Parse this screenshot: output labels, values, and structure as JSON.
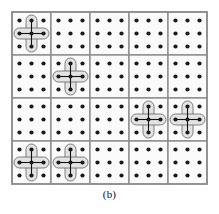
{
  "figure": {
    "caption": "(b)",
    "type": "grid-diagram"
  },
  "colors": {
    "background": "#ffffff",
    "cell_fill": "#fbfbfb",
    "cell_border": "#8c8c8c",
    "outer_border": "#8c8c8c",
    "dot": "#1a1a1a",
    "overlay_fill": "#e3e3e3",
    "overlay_stroke": "#6f6f6f",
    "overlay_link": "#111111",
    "caption_text": "#111111"
  },
  "geometry": {
    "origin_x": 12,
    "origin_y": 12,
    "cell_width": 39,
    "cell_height": 43,
    "cols": 5,
    "rows": 4,
    "dots_per_cell_x": 3,
    "dots_per_cell_y": 3,
    "dot_radius": 2.1,
    "dot_inset_x": 7.5,
    "dot_inset_y": 8.5,
    "dot_step_x": 12,
    "dot_step_y": 13,
    "overlay_capsule_width": 11,
    "overlay_corner_radius": 5.5,
    "cell_border_width": 1.4,
    "outer_border_width": 1.6
  },
  "grid": {
    "column_lines_x": [
      12,
      51,
      90,
      129,
      168,
      207
    ],
    "row_lines_y": [
      12,
      55,
      98,
      141,
      184
    ]
  },
  "cells": [
    {
      "row": 0,
      "col": 0,
      "has_overlay": true
    },
    {
      "row": 0,
      "col": 1,
      "has_overlay": false
    },
    {
      "row": 0,
      "col": 2,
      "has_overlay": false
    },
    {
      "row": 0,
      "col": 3,
      "has_overlay": false
    },
    {
      "row": 0,
      "col": 4,
      "has_overlay": false
    },
    {
      "row": 1,
      "col": 0,
      "has_overlay": false
    },
    {
      "row": 1,
      "col": 1,
      "has_overlay": true
    },
    {
      "row": 1,
      "col": 2,
      "has_overlay": false
    },
    {
      "row": 1,
      "col": 3,
      "has_overlay": false
    },
    {
      "row": 1,
      "col": 4,
      "has_overlay": false
    },
    {
      "row": 2,
      "col": 0,
      "has_overlay": false
    },
    {
      "row": 2,
      "col": 1,
      "has_overlay": false
    },
    {
      "row": 2,
      "col": 2,
      "has_overlay": false
    },
    {
      "row": 2,
      "col": 3,
      "has_overlay": true
    },
    {
      "row": 2,
      "col": 4,
      "has_overlay": true
    },
    {
      "row": 3,
      "col": 0,
      "has_overlay": true
    },
    {
      "row": 3,
      "col": 1,
      "has_overlay": true
    },
    {
      "row": 3,
      "col": 2,
      "has_overlay": false
    },
    {
      "row": 3,
      "col": 3,
      "has_overlay": false
    },
    {
      "row": 3,
      "col": 4,
      "has_overlay": false
    }
  ],
  "overlays": [
    {
      "id": "overlay-r0c0",
      "row": 0,
      "col": 0,
      "shape": "plus-pentomino",
      "center_dot": [
        1,
        1
      ]
    },
    {
      "id": "overlay-r1c1",
      "row": 1,
      "col": 1,
      "shape": "plus-pentomino",
      "center_dot": [
        1,
        1
      ]
    },
    {
      "id": "overlay-r2c3",
      "row": 2,
      "col": 3,
      "shape": "plus-pentomino",
      "center_dot": [
        1,
        1
      ]
    },
    {
      "id": "overlay-r2c4",
      "row": 2,
      "col": 4,
      "shape": "plus-pentomino",
      "center_dot": [
        1,
        1
      ]
    },
    {
      "id": "overlay-r3c0",
      "row": 3,
      "col": 0,
      "shape": "plus-pentomino",
      "center_dot": [
        1,
        1
      ]
    },
    {
      "id": "overlay-r3c1",
      "row": 3,
      "col": 1,
      "shape": "plus-pentomino",
      "center_dot": [
        1,
        1
      ]
    }
  ]
}
